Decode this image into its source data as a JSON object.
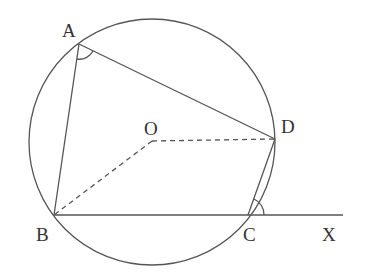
{
  "diagram": {
    "type": "circle-geometry",
    "points": {
      "A": {
        "label": "A"
      },
      "B": {
        "label": "B"
      },
      "C": {
        "label": "C"
      },
      "D": {
        "label": "D"
      },
      "O": {
        "label": "O"
      },
      "X": {
        "label": "X"
      }
    },
    "segments": [
      {
        "from": "A",
        "to": "B",
        "style": "solid"
      },
      {
        "from": "A",
        "to": "D",
        "style": "solid"
      },
      {
        "from": "D",
        "to": "C",
        "style": "solid"
      },
      {
        "from": "B",
        "to": "X",
        "style": "solid",
        "passes_through": "C"
      },
      {
        "from": "O",
        "to": "B",
        "style": "dashed"
      },
      {
        "from": "O",
        "to": "D",
        "style": "dashed"
      }
    ],
    "angles_marked": [
      "BAD",
      "DCX"
    ],
    "circle": {
      "center": "O"
    }
  }
}
